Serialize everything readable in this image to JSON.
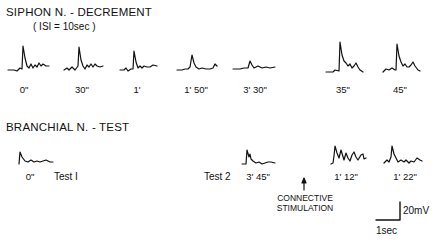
{
  "figure": {
    "siphon_panel": {
      "title": "SIPHON N. - DECREMENT",
      "subtitle": "( ISI = 10sec )",
      "traces": [
        {
          "label": "0\"",
          "x": 24
        },
        {
          "label": "30\"",
          "x": 80
        },
        {
          "label": "1'",
          "x": 135
        },
        {
          "label": "1' 50\"",
          "x": 195
        },
        {
          "label": "3' 30\"",
          "x": 253
        },
        {
          "label": "35\"",
          "x": 340
        },
        {
          "label": "45\"",
          "x": 397
        }
      ]
    },
    "branchial_panel": {
      "title": "BRANCHIAL N. - TEST",
      "traces": [
        {
          "label": "0\"",
          "x": 25
        },
        {
          "label": "3' 45\"",
          "x": 262
        },
        {
          "label": "1' 12\"",
          "x": 343
        },
        {
          "label": "1' 22\"",
          "x": 402
        }
      ],
      "test1_label": "Test I",
      "test2_label": "Test 2",
      "stimulation_label_line1": "CONNECTIVE",
      "stimulation_label_line2": "STIMULATION"
    },
    "scale_bar": {
      "voltage": "20mV",
      "time": "1sec"
    }
  }
}
